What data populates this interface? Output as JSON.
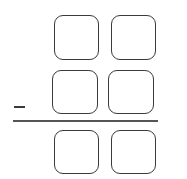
{
  "problem": {
    "operation": "subtraction",
    "operator_symbol": "-",
    "rows": [
      {
        "role": "minuend",
        "digits": [
          "",
          ""
        ]
      },
      {
        "role": "subtrahend",
        "digits": [
          "",
          ""
        ]
      },
      {
        "role": "difference",
        "digits": [
          "",
          ""
        ]
      }
    ]
  },
  "colors": {
    "stroke": "#3a3a3a",
    "background": "#ffffff"
  }
}
